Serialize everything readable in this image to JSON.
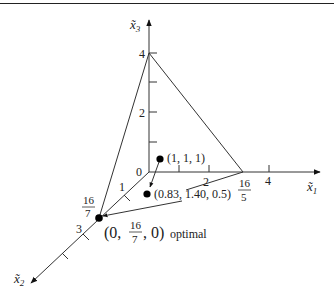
{
  "figure": {
    "axes": {
      "x1": {
        "label": "x̃",
        "sub": "1",
        "ticks": [
          "2",
          "4"
        ],
        "vertex_num": "16",
        "vertex_den": "5"
      },
      "x2": {
        "label": "x̃",
        "sub": "2",
        "ticks": [
          "1",
          "3"
        ],
        "vertex_num": "16",
        "vertex_den": "7"
      },
      "x3": {
        "label": "x̃",
        "sub": "3",
        "ticks": [
          "2",
          "4"
        ]
      },
      "origin": "0"
    },
    "points": [
      {
        "label": "(1, 1, 1)"
      },
      {
        "label": "(0.83, 1.40, 0.5)"
      },
      {
        "label_prefix": "(0,",
        "num": "16",
        "den": "7",
        "label_suffix": ", 0)",
        "note": "optimal"
      }
    ],
    "colors": {
      "line": "#333333",
      "point": "#000000"
    }
  }
}
